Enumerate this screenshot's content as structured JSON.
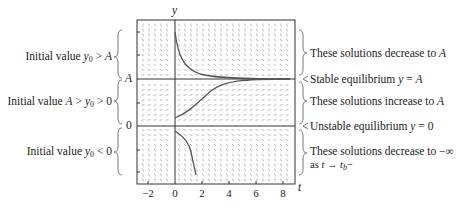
{
  "diagram": {
    "axes": {
      "x_label": "t",
      "y_label": "y",
      "x_ticks": [
        "−2",
        "0",
        "2",
        "4",
        "6",
        "8"
      ],
      "y_levels": [
        "A",
        "0"
      ]
    },
    "left_annotations": [
      {
        "prefix": "Initial value ",
        "math": "y0 > A"
      },
      {
        "prefix": "Initial value ",
        "math": "A > y0 > 0"
      },
      {
        "prefix": "Initial value ",
        "math": "y0 < 0"
      }
    ],
    "right_annotations": [
      {
        "text": "These solutions decrease to ",
        "math": "A"
      },
      {
        "text": "Stable equilibrium ",
        "math": "y = A"
      },
      {
        "text": "These solutions increase to ",
        "math": "A"
      },
      {
        "text": "Unstable equilibrium ",
        "math": "y = 0"
      },
      {
        "text": "These solutions decrease to −∞",
        "line2": "as t → tb−"
      }
    ],
    "colors": {
      "axis": "#333333",
      "curve": "#555555",
      "field": "#9a9a9a",
      "brace": "#777777"
    }
  }
}
